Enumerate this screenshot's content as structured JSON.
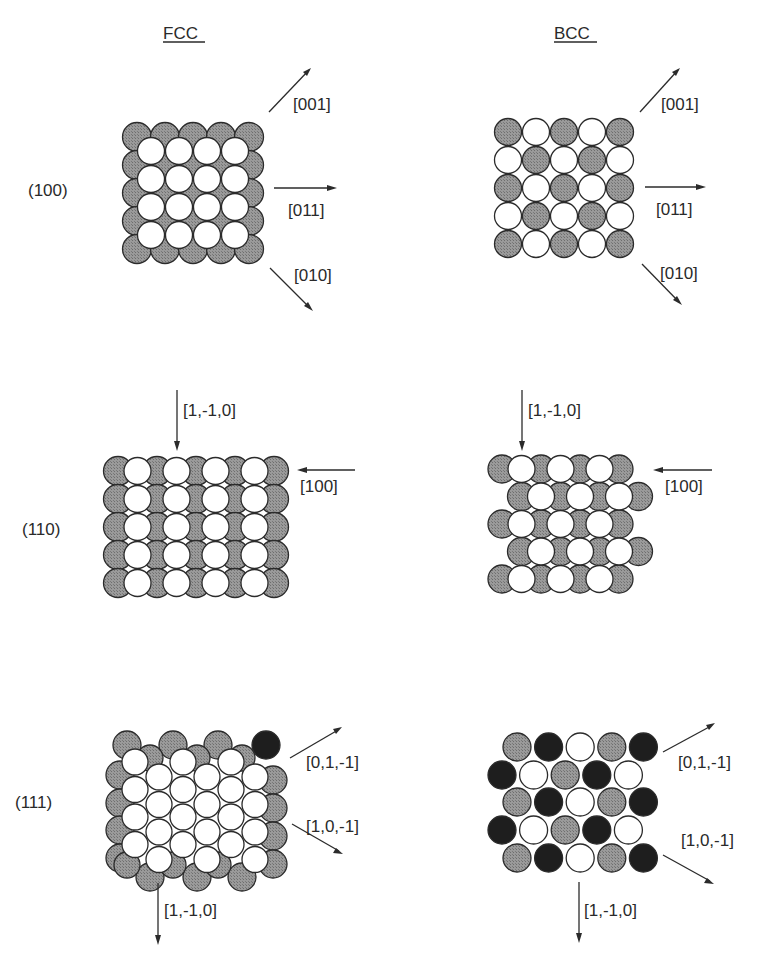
{
  "colors": {
    "gray_atom": "#8a8a8a",
    "white_atom": "#ffffff",
    "black_atom": "#1e1e1e",
    "outline": "#2b2b2b",
    "text": "#2a2a2a"
  },
  "columns": [
    {
      "id": "fcc",
      "title": "FCC"
    },
    {
      "id": "bcc",
      "title": "BCC"
    }
  ],
  "rows": [
    {
      "id": "100",
      "label": "(100)"
    },
    {
      "id": "110",
      "label": "(110)"
    },
    {
      "id": "111",
      "label": "(111)"
    }
  ],
  "panels": {
    "fcc_100": {
      "arrows": [
        {
          "direction": "up-right",
          "label": "[001]"
        },
        {
          "direction": "right",
          "label": "[011]"
        },
        {
          "direction": "down-right",
          "label": "[010]"
        }
      ]
    },
    "bcc_100": {
      "arrows": [
        {
          "direction": "up-right",
          "label": "[001]"
        },
        {
          "direction": "right",
          "label": "[011]"
        },
        {
          "direction": "down-right",
          "label": "[010]"
        }
      ]
    },
    "fcc_110": {
      "arrows": [
        {
          "direction": "down",
          "label": "[1,-1,0]"
        },
        {
          "direction": "left",
          "label": "[100]"
        }
      ]
    },
    "bcc_110": {
      "arrows": [
        {
          "direction": "down",
          "label": "[1,-1,0]"
        },
        {
          "direction": "left",
          "label": "[100]"
        }
      ]
    },
    "fcc_111": {
      "arrows": [
        {
          "direction": "up-right",
          "label": "[0,1,-1]"
        },
        {
          "direction": "down-right",
          "label": "[1,0,-1]"
        },
        {
          "direction": "down",
          "label": "[1,-1,0]"
        }
      ]
    },
    "bcc_111": {
      "arrows": [
        {
          "direction": "up-right",
          "label": "[0,1,-1]"
        },
        {
          "direction": "down-right",
          "label": "[1,0,-1]"
        },
        {
          "direction": "down",
          "label": "[1,-1,0]"
        }
      ],
      "layer_pattern": [
        [
          "gray",
          "black",
          "white",
          "gray",
          "black"
        ],
        [
          "black",
          "white",
          "gray",
          "black",
          "white"
        ],
        [
          "gray",
          "black",
          "white",
          "gray",
          "black"
        ],
        [
          "black",
          "white",
          "gray",
          "black",
          "white"
        ],
        [
          "gray",
          "black",
          "white",
          "gray",
          "black"
        ]
      ]
    }
  }
}
